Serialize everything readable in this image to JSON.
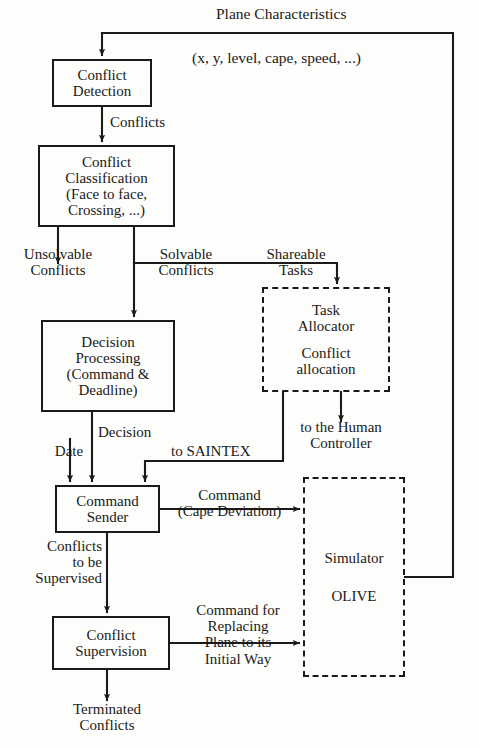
{
  "diagram": {
    "title": "Plane Characteristics",
    "subtitle": "(x, y, level, cape, speed, ...)",
    "nodes": {
      "conflict_detection": {
        "lines": [
          "Conflict",
          "Detection"
        ],
        "style": "solid"
      },
      "conflict_classification": {
        "lines": [
          "Conflict",
          "Classification",
          "(Face to face,",
          "Crossing, ...)"
        ],
        "style": "solid"
      },
      "decision_processing": {
        "lines": [
          "Decision",
          "Processing",
          "(Command &",
          "Deadline)"
        ],
        "style": "solid"
      },
      "command_sender": {
        "lines": [
          "Command",
          "Sender"
        ],
        "style": "solid"
      },
      "conflict_supervision": {
        "lines": [
          "Conflict",
          "Supervision"
        ],
        "style": "solid"
      },
      "task_allocator": {
        "lines": [
          "Task",
          "Allocator",
          "",
          "Conflict",
          "allocation"
        ],
        "style": "dashed"
      },
      "simulator": {
        "lines": [
          "Simulator",
          "",
          "OLIVE"
        ],
        "style": "dashed"
      }
    },
    "edge_labels": {
      "conflicts": [
        "Conflicts"
      ],
      "unsolvable_conflicts": [
        "Unsolvable",
        "Conflicts"
      ],
      "solvable_conflicts": [
        "Solvable",
        "Conflicts"
      ],
      "shareable_tasks": [
        "Shareable",
        "Tasks"
      ],
      "to_human_controller": [
        "to the Human",
        "Controller"
      ],
      "to_saintex": [
        "to SAINTEX"
      ],
      "date": [
        "Date"
      ],
      "decision": [
        "Decision"
      ],
      "command_cape_deviation": [
        "Command",
        "(Cape Deviation)"
      ],
      "conflicts_to_be_supervised": [
        "Conflicts",
        "to be",
        "Supervised"
      ],
      "command_for_replacing": [
        "Command for",
        "Replacing",
        "Plane to its",
        "Initial Way"
      ],
      "terminated_conflicts": [
        "Terminated",
        "Conflicts"
      ]
    },
    "colors": {
      "ink": "#1a1a1a",
      "paper": "#fdfdfb"
    }
  }
}
